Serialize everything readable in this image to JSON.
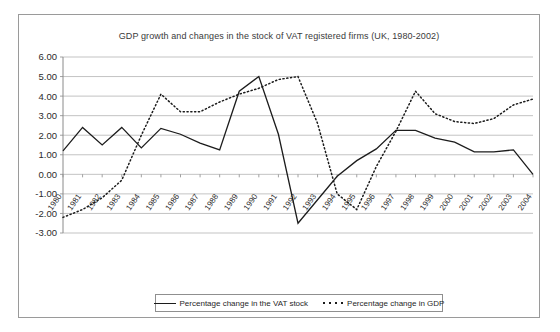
{
  "figure": {
    "title": "GDP growth and changes in the stock of VAT registered firms (UK, 1980-2002)"
  },
  "legend": {
    "position": "bottom-center",
    "entries": [
      {
        "label": "Percentage change in the VAT stock",
        "style": "solid"
      },
      {
        "label": "Percentage change in GDP",
        "style": "dotted"
      }
    ]
  },
  "axes": {
    "y_ticks": [
      "6.00",
      "5.00",
      "4.00",
      "3.00",
      "2.00",
      "1.00",
      "0.00",
      "-1.00",
      "-2.00",
      "-3.00"
    ],
    "x_ticks": [
      "1980",
      "1981",
      "1982",
      "1983",
      "1984",
      "1985",
      "1986",
      "1987",
      "1988",
      "1989",
      "1990",
      "1991",
      "1992",
      "1993",
      "1994",
      "1995",
      "1996",
      "1997",
      "1998",
      "1999",
      "2000",
      "2001",
      "2002",
      "2003",
      "2004"
    ]
  },
  "chart_data": {
    "type": "line",
    "title": "GDP growth and changes in the stock of VAT registered firms (UK, 1980-2002)",
    "xlabel": "",
    "ylabel": "",
    "ylim": [
      -3.0,
      6.0
    ],
    "ytick_step": 1.0,
    "grid": true,
    "legend_position": "bottom-center",
    "x": [
      1980,
      1981,
      1982,
      1983,
      1984,
      1985,
      1986,
      1987,
      1988,
      1989,
      1990,
      1991,
      1992,
      1993,
      1994,
      1995,
      1996,
      1997,
      1998,
      1999,
      2000,
      2001,
      2002,
      2003,
      2004
    ],
    "series": [
      {
        "name": "Percentage change in the VAT stock",
        "style": "solid",
        "values": [
          1.2,
          2.4,
          1.5,
          2.4,
          1.35,
          2.35,
          2.05,
          1.6,
          1.25,
          4.25,
          5.0,
          2.05,
          -2.5,
          -1.3,
          -0.1,
          0.7,
          1.3,
          2.25,
          2.25,
          1.85,
          1.65,
          1.15,
          1.15,
          1.25,
          0.0
        ]
      },
      {
        "name": "Percentage change in GDP",
        "style": "dotted",
        "values": [
          -2.2,
          -1.8,
          -1.2,
          -0.3,
          2.0,
          4.1,
          3.2,
          3.2,
          3.7,
          4.1,
          4.4,
          4.85,
          5.0,
          2.6,
          -1.0,
          -1.8,
          0.4,
          2.2,
          4.25,
          3.1,
          2.7,
          2.6,
          2.85,
          3.55,
          3.85
        ]
      }
    ]
  }
}
